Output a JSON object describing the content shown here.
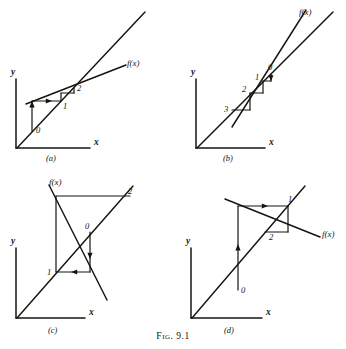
{
  "figure": {
    "caption_prefix": "Fig.",
    "caption_number": "9.1",
    "ink_color": "#15140f",
    "background_color": "#ffffff"
  },
  "panels": [
    {
      "id": "a",
      "tag": "(a)",
      "axis_x_label": "x",
      "axis_y_label": "y",
      "curve_label": "f(x)",
      "point_labels": [
        "0",
        "1",
        "2"
      ],
      "description": "monotone convergence staircase"
    },
    {
      "id": "b",
      "tag": "(b)",
      "axis_x_label": "x",
      "axis_y_label": "y",
      "curve_label": "f(x)",
      "point_labels": [
        "0",
        "1",
        "2",
        "3"
      ],
      "description": "monotone divergence staircase"
    },
    {
      "id": "c",
      "tag": "(c)",
      "axis_x_label": "x",
      "axis_y_label": "y",
      "curve_label": "f(x)",
      "point_labels": [
        "0",
        "1",
        "2"
      ],
      "description": "oscillatory divergence spiral"
    },
    {
      "id": "d",
      "tag": "(d)",
      "axis_x_label": "x",
      "axis_y_label": "y",
      "curve_label": "f(x)",
      "point_labels": [
        "0",
        "1",
        "2"
      ],
      "description": "oscillatory convergence spiral"
    }
  ]
}
